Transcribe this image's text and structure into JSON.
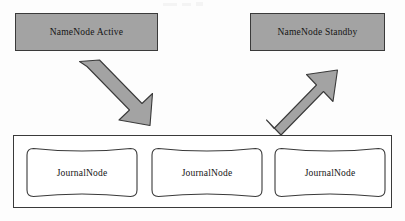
{
  "diagram": {
    "colors": {
      "node_fill": "#a3a3a3",
      "node_border": "#3a3a3a",
      "arrow_fill": "#a3a3a3",
      "arrow_border": "#3a3a3a",
      "container_fill": "#ffffff",
      "container_border": "#3a3a3a",
      "page_background": "#fdfdfd",
      "text": "#141414"
    },
    "namenodes": [
      {
        "id": "namenode-active",
        "label": "NameNode Active"
      },
      {
        "id": "namenode-standby",
        "label": "NameNode Standby"
      }
    ],
    "arrows": [
      {
        "id": "arrow-active-to-journal",
        "direction": "down-right",
        "from": "NameNode Active",
        "to": "JournalNode cluster",
        "semantics": "writes edits"
      },
      {
        "id": "arrow-journal-to-standby",
        "direction": "up-right",
        "from": "JournalNode cluster",
        "to": "NameNode Standby",
        "semantics": "reads edits"
      }
    ],
    "journal_cluster": {
      "id": "journalnode-cluster",
      "nodes": [
        {
          "id": "journalnode-1",
          "label": "JournalNode"
        },
        {
          "id": "journalnode-2",
          "label": "JournalNode"
        },
        {
          "id": "journalnode-3",
          "label": "JournalNode"
        }
      ]
    }
  }
}
